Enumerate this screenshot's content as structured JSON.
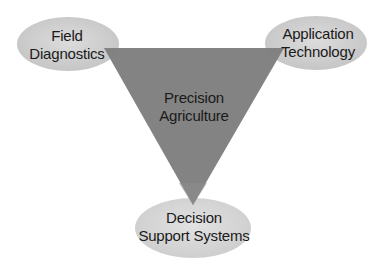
{
  "diagram": {
    "center": {
      "lines": [
        "Precision",
        "Agriculture"
      ]
    },
    "nodes": [
      {
        "id": "field-diagnostics",
        "lines": [
          "Field",
          "Diagnostics"
        ],
        "position": "top-left"
      },
      {
        "id": "application-technology",
        "lines": [
          "Application",
          "Technology"
        ],
        "position": "top-right"
      },
      {
        "id": "decision-support-systems",
        "lines": [
          "Decision",
          "Support Systems"
        ],
        "position": "bottom"
      }
    ],
    "colors": {
      "triangle": "#7f7f7f",
      "ellipse_fill": "#cbcbcb",
      "ellipse_highlight": "#dedede",
      "text": "#1a1a1a",
      "background": "#ffffff"
    }
  }
}
